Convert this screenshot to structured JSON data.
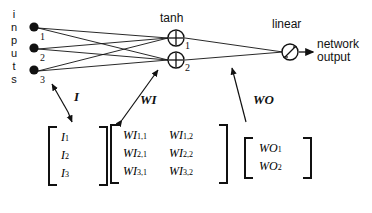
{
  "figure": {
    "type": "neural-network-diagram"
  },
  "inputs": {
    "vertical_label": "inputs",
    "letters": [
      "i",
      "n",
      "p",
      "u",
      "t",
      "s"
    ],
    "nodes": [
      {
        "label": "1"
      },
      {
        "label": "2"
      },
      {
        "label": "3"
      }
    ]
  },
  "hidden_layer": {
    "title": "tanh",
    "nodes": [
      {
        "label": "1",
        "symbol": "+"
      },
      {
        "label": "2",
        "symbol": "+"
      }
    ]
  },
  "output_layer": {
    "title": "linear",
    "node": {
      "symbol": "/"
    },
    "output_label_line1": "network",
    "output_label_line2": "output"
  },
  "annotations": {
    "input_vector_arrow": "I",
    "input_weight_arrow": "WI",
    "output_weight_arrow": "WO"
  },
  "matrices": {
    "input_vector": {
      "name": "I",
      "rows": [
        [
          {
            "base": "I",
            "sub": "1"
          }
        ],
        [
          {
            "base": "I",
            "sub": "2"
          }
        ],
        [
          {
            "base": "I",
            "sub": "3"
          }
        ]
      ]
    },
    "input_weights": {
      "name": "WI",
      "rows": [
        [
          {
            "base": "WI",
            "sub": "1,1"
          },
          {
            "base": "WI",
            "sub": "1,2"
          }
        ],
        [
          {
            "base": "WI",
            "sub": "2,1"
          },
          {
            "base": "WI",
            "sub": "2,2"
          }
        ],
        [
          {
            "base": "WI",
            "sub": "3,1"
          },
          {
            "base": "WI",
            "sub": "3,2"
          }
        ]
      ]
    },
    "output_weights": {
      "name": "WO",
      "rows": [
        [
          {
            "base": "WO",
            "sub": "1"
          }
        ],
        [
          {
            "base": "WO",
            "sub": "2"
          }
        ]
      ]
    }
  },
  "colors": {
    "ink": "#111111",
    "background": "#ffffff"
  }
}
